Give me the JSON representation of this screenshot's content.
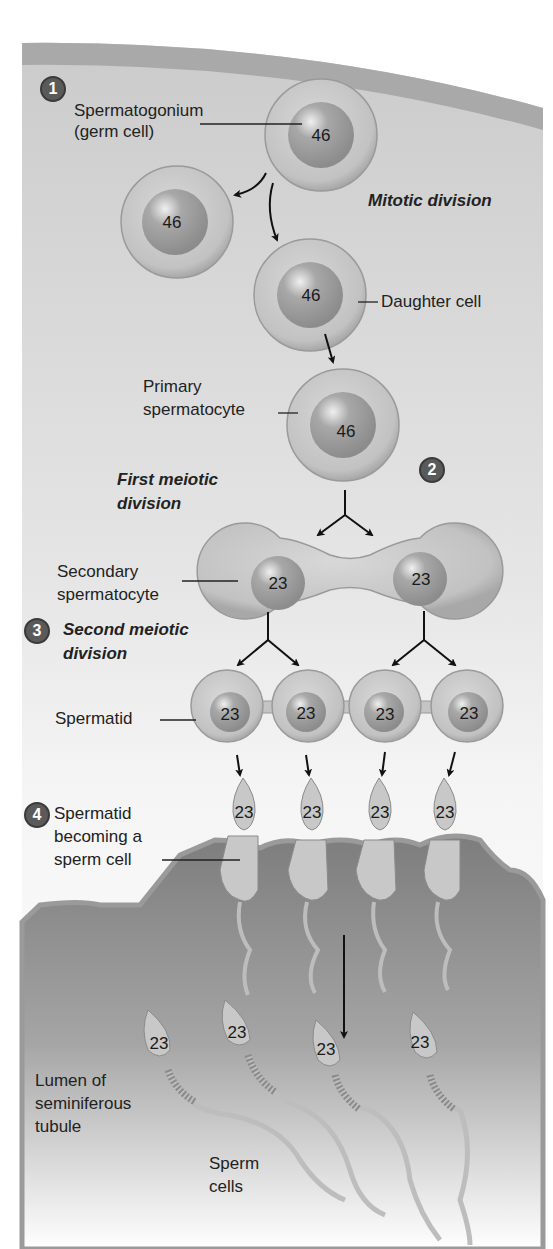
{
  "diagram": {
    "topic": "Spermatogenesis",
    "steps": [
      {
        "badge": "1",
        "label": "Mitotic division"
      },
      {
        "badge": "2",
        "label": "First meiotic division"
      },
      {
        "badge": "3",
        "label": "Second meiotic division"
      },
      {
        "badge": "4",
        "label": "Spermatid becoming a sperm cell"
      }
    ],
    "labels": {
      "spermatogonium_1": "Spermatogonium",
      "spermatogonium_2": "(germ cell)",
      "mitotic": "Mitotic division",
      "daughter": "Daughter cell",
      "primary_1": "Primary",
      "primary_2": "spermatocyte",
      "first_meiotic_1": "First meiotic",
      "first_meiotic_2": "division",
      "secondary_1": "Secondary",
      "secondary_2": "spermatocyte",
      "second_meiotic_1": "Second meiotic",
      "second_meiotic_2": "division",
      "spermatid": "Spermatid",
      "becoming_1": "Spermatid",
      "becoming_2": "becoming a",
      "becoming_3": "sperm cell",
      "lumen_1": "Lumen of",
      "lumen_2": "seminiferous",
      "lumen_3": "tubule",
      "sperm_1": "Sperm",
      "sperm_2": "cells"
    },
    "chromosome_counts": {
      "spermatogonium": "46",
      "daughter_left": "46",
      "daughter_right": "46",
      "primary": "46",
      "secondary": [
        "23",
        "23"
      ],
      "spermatids": [
        "23",
        "23",
        "23",
        "23"
      ],
      "becoming": [
        "23",
        "23",
        "23",
        "23"
      ],
      "sperm": [
        "23",
        "23",
        "23",
        "23"
      ]
    },
    "colors": {
      "background_top": "#cfcfcf",
      "background_mid": "#f2f2f2",
      "outer_band": "#a9a9a9",
      "tissue": "#8a8a8a",
      "cell_fill": "#c4c4c4",
      "nucleus_fill": "#9a9a9a",
      "badge_fill": "#5a5a5a"
    }
  }
}
